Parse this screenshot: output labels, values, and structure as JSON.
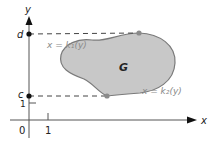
{
  "diagram": {
    "type": "region-between-curves",
    "region_label": "G",
    "axes": {
      "x_label": "x",
      "y_label": "y",
      "origin_label": "0",
      "x_tick_label": "1",
      "y_tick_label": "1"
    },
    "bounds": {
      "top_label": "d",
      "bottom_label": "c"
    },
    "curves": {
      "left_label": "x = k₁(y)",
      "right_label": "x = k₂(y)"
    },
    "colors": {
      "region_fill": "#c8c8c8",
      "region_stroke": "#7a7a7a",
      "axis": "#333333",
      "dashed": "#444444",
      "point_axis": "#111111",
      "point_curve": "#8a8a8a",
      "curve_label": "#8a8a8a",
      "text": "#222222"
    }
  }
}
